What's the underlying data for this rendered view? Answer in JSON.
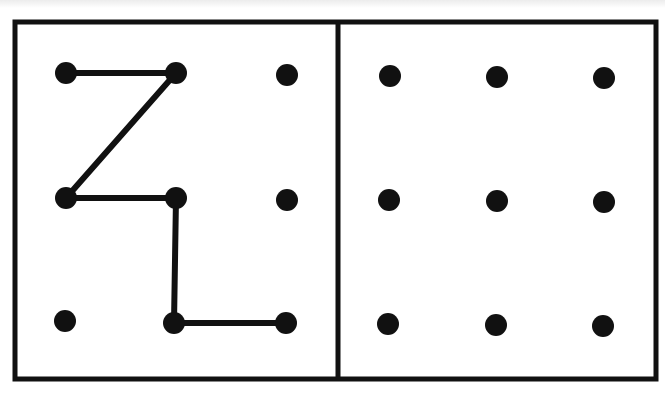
{
  "figure": {
    "stroke_color": "#111111",
    "background": "#ffffff",
    "panels": [
      {
        "id": "left",
        "grid": {
          "rows": 3,
          "cols": 3
        },
        "dot_positions": [
          [
            66,
            73
          ],
          [
            176,
            73
          ],
          [
            287,
            75
          ],
          [
            66,
            198
          ],
          [
            176,
            198
          ],
          [
            287,
            200
          ],
          [
            65,
            321
          ],
          [
            174,
            323
          ],
          [
            286,
            323
          ]
        ],
        "path_grid_coords": [
          [
            0,
            0
          ],
          [
            1,
            0
          ],
          [
            0,
            1
          ],
          [
            1,
            1
          ],
          [
            1,
            2
          ],
          [
            2,
            2
          ]
        ],
        "path_pixels": [
          [
            66,
            73
          ],
          [
            176,
            73
          ],
          [
            66,
            198
          ],
          [
            176,
            198
          ],
          [
            174,
            323
          ],
          [
            286,
            323
          ]
        ]
      },
      {
        "id": "right",
        "grid": {
          "rows": 3,
          "cols": 3
        },
        "dot_positions": [
          [
            390,
            76
          ],
          [
            497,
            77
          ],
          [
            604,
            78
          ],
          [
            389,
            200
          ],
          [
            497,
            201
          ],
          [
            604,
            202
          ],
          [
            388,
            324
          ],
          [
            496,
            325
          ],
          [
            603,
            326
          ]
        ],
        "path_grid_coords": [],
        "path_pixels": []
      }
    ]
  }
}
